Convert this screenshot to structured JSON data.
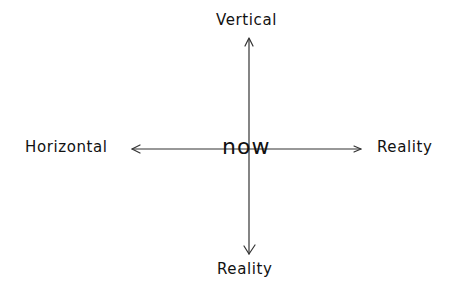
{
  "diagram": {
    "type": "axes-cross",
    "style": "hand-drawn",
    "center": {
      "label": "now"
    },
    "axes": {
      "top": {
        "label": "Vertical",
        "direction": "up"
      },
      "left": {
        "label": "Horizontal",
        "direction": "left"
      },
      "right": {
        "label": "Reality",
        "direction": "right"
      },
      "bottom": {
        "label": "Reality",
        "direction": "down"
      }
    },
    "colors": {
      "background": "#ffffff",
      "ink": "#111111",
      "line": "#333333"
    }
  }
}
